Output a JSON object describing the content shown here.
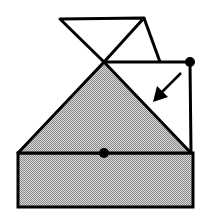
{
  "diagram": {
    "colors": {
      "stroke": "#000000",
      "fill_shaded": "#b8b8b8",
      "fill_paper": "#ffffff",
      "background": "#ffffff"
    },
    "elements": {
      "top_flap": "bow-tie triangles",
      "shaded_triangle": "gray triangle",
      "base_rectangle": "gray rectangle",
      "hinge_point_top": "filled dot",
      "hinge_point_center": "filled dot",
      "fold_arrow": "arrow pointing down-left"
    }
  }
}
